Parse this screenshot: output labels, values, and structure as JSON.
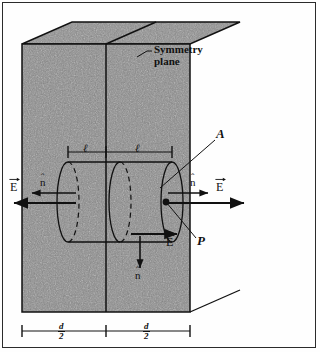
{
  "figure": {
    "type": "physics-diagram",
    "background_color": "#fefefe",
    "slab_fill_color": "#8a8a8a",
    "line_color": "#111111",
    "border_color": "#2b2b2b"
  },
  "labels": {
    "symmetry_plane_line1": "Symmetry",
    "symmetry_plane_line2": "plane",
    "area_A": "A",
    "point_P": "P",
    "ell_left": "ℓ",
    "ell_right": "ℓ",
    "n_hat_left": "n",
    "n_hat_right": "n",
    "n_hat_down": "n",
    "E_left": "E",
    "E_right": "E",
    "E_bottom": "E",
    "hat_symbol": "ˆ",
    "d_half_left_num": "d",
    "d_half_left_den": "2",
    "d_half_right_num": "d",
    "d_half_right_den": "2"
  },
  "geometry": {
    "slab_front_left_x": 22,
    "slab_front_right_x": 190,
    "slab_top_y": 44,
    "slab_bottom_y": 312,
    "symmetry_plane_x": 106,
    "depth_dx": 50,
    "depth_dy": -22,
    "cylinder_left_x": 68,
    "cylinder_right_x": 172,
    "cylinder_mid_x": 120,
    "cylinder_axis_y": 202,
    "cylinder_ry": 40,
    "cylinder_rx": 11,
    "point_P_x": 166,
    "point_P_y": 202
  }
}
